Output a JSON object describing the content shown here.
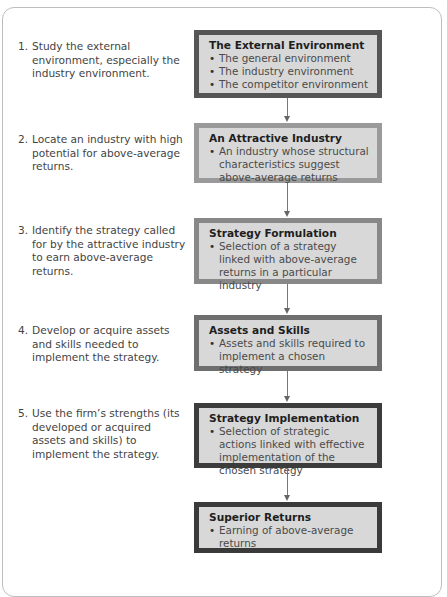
{
  "steps": [
    {
      "num": "1.",
      "text": "Study the external environment, especially the industry environment."
    },
    {
      "num": "2.",
      "text": "Locate an industry with high potential for above-average returns."
    },
    {
      "num": "3.",
      "text": "Identify the strategy called for by the attractive industry to earn above-average returns."
    },
    {
      "num": "4.",
      "text": "Develop or acquire assets and skills needed to implement the strategy."
    },
    {
      "num": "5.",
      "text": "Use the firm’s strengths (its developed or acquired assets and skills) to implement the strategy."
    }
  ],
  "boxes": [
    {
      "title": "The External Environment",
      "border": "#555555",
      "bullets": [
        "The general environment",
        "The industry environment",
        "The competitor environment"
      ]
    },
    {
      "title": "An Attractive Industry",
      "border": "#9a9a9a",
      "bullets": [
        "An industry whose structural characteristics suggest above-average returns"
      ]
    },
    {
      "title": "Strategy Formulation",
      "border": "#888888",
      "bullets": [
        "Selection of a strategy linked with above-average returns in a particular industry"
      ]
    },
    {
      "title": "Assets and Skills",
      "border": "#6e6e6e",
      "bullets": [
        "Assets and skills required to implement a chosen strategy"
      ]
    },
    {
      "title": "Strategy Implementation",
      "border": "#3c3c3c",
      "bullets": [
        "Selection of strategic actions linked with effective implementation of the chosen strategy"
      ]
    },
    {
      "title": "Superior Returns",
      "border": "#3a3a3a",
      "bullets": [
        "Earning of above-average returns"
      ]
    }
  ]
}
